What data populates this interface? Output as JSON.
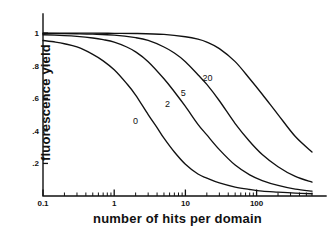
{
  "chart_data": {
    "type": "line",
    "title": "",
    "xlabel": "number of hits  per domain",
    "ylabel": "fluorescence  yield",
    "xscale": "log",
    "yscale": "linear",
    "xlim": [
      0.1,
      600
    ],
    "ylim": [
      0,
      1.05
    ],
    "grid": false,
    "legend_position": "inline-curve-labels",
    "x_ticks": [
      {
        "value": 0.1,
        "label": "0.1"
      },
      {
        "value": 1,
        "label": "1"
      },
      {
        "value": 10,
        "label": "10"
      },
      {
        "value": 100,
        "label": "100"
      }
    ],
    "y_ticks": [
      {
        "value": 1.0,
        "label": "1"
      },
      {
        "value": 0.8,
        "label": ".8"
      },
      {
        "value": 0.6,
        "label": ".6"
      },
      {
        "value": 0.4,
        "label": ".4"
      },
      {
        "value": 0.2,
        "label": ".2"
      }
    ],
    "series": [
      {
        "name": "0",
        "label": "0",
        "label_x": 2.0,
        "label_y": 0.44,
        "x": [
          0.1,
          0.15,
          0.2,
          0.3,
          0.5,
          0.7,
          1.0,
          1.5,
          2.0,
          3.0,
          4.0,
          5.0,
          7.0,
          10.0,
          15.0,
          20.0,
          30.0,
          50.0,
          80.0,
          120.0,
          200.0,
          350.0,
          600.0
        ],
        "y": [
          0.955,
          0.945,
          0.935,
          0.915,
          0.87,
          0.83,
          0.775,
          0.69,
          0.62,
          0.5,
          0.42,
          0.355,
          0.27,
          0.195,
          0.135,
          0.11,
          0.08,
          0.055,
          0.04,
          0.03,
          0.024,
          0.018,
          0.014
        ]
      },
      {
        "name": "2",
        "label": "2",
        "label_x": 5.6,
        "label_y": 0.545,
        "x": [
          0.1,
          0.2,
          0.3,
          0.5,
          0.7,
          1.0,
          1.5,
          2.0,
          3.0,
          5.0,
          7.0,
          10.0,
          15.0,
          20.0,
          30.0,
          50.0,
          80.0,
          120.0,
          200.0,
          350.0,
          600.0
        ],
        "y": [
          0.99,
          0.985,
          0.98,
          0.97,
          0.96,
          0.945,
          0.915,
          0.885,
          0.825,
          0.72,
          0.64,
          0.55,
          0.44,
          0.375,
          0.285,
          0.19,
          0.13,
          0.095,
          0.065,
          0.042,
          0.03
        ]
      },
      {
        "name": "5",
        "label": "5",
        "label_x": 9.3,
        "label_y": 0.615,
        "x": [
          0.1,
          0.3,
          0.5,
          1.0,
          2.0,
          3.0,
          5.0,
          7.0,
          10.0,
          15.0,
          20.0,
          30.0,
          50.0,
          80.0,
          120.0,
          200.0,
          350.0,
          600.0
        ],
        "y": [
          0.998,
          0.996,
          0.994,
          0.988,
          0.972,
          0.955,
          0.915,
          0.878,
          0.825,
          0.745,
          0.685,
          0.585,
          0.445,
          0.335,
          0.255,
          0.18,
          0.12,
          0.085
        ]
      },
      {
        "name": "20",
        "label": "20",
        "label_x": 20.5,
        "label_y": 0.705,
        "x": [
          0.1,
          0.5,
          1.0,
          2.0,
          5.0,
          10.0,
          15.0,
          20.0,
          30.0,
          50.0,
          80.0,
          120.0,
          200.0,
          350.0,
          600.0
        ],
        "y": [
          1.0,
          1.0,
          0.999,
          0.998,
          0.992,
          0.978,
          0.963,
          0.945,
          0.905,
          0.825,
          0.72,
          0.625,
          0.5,
          0.365,
          0.27
        ]
      }
    ]
  }
}
